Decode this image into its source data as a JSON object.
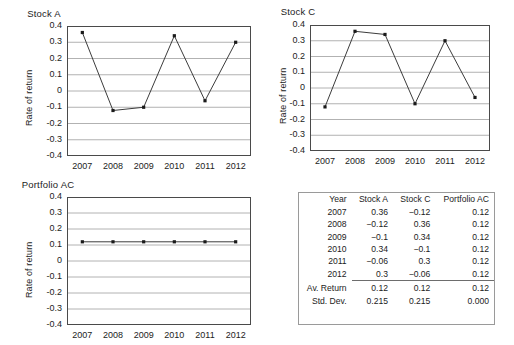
{
  "chart_data": [
    {
      "type": "line",
      "name": "stock-a",
      "title": "Stock A",
      "xlabel": "",
      "ylabel": "Rate of return",
      "categories": [
        "2007",
        "2008",
        "2009",
        "2010",
        "2011",
        "2012"
      ],
      "values": [
        0.36,
        -0.12,
        -0.1,
        0.34,
        -0.06,
        0.3
      ],
      "ylim": [
        -0.4,
        0.4
      ],
      "yticks": [
        "0.4",
        "0.3",
        "0.2",
        "0.1",
        "0",
        "-0.1",
        "-0.2",
        "-0.3",
        "-0.4"
      ],
      "ytick_values": [
        0.4,
        0.3,
        0.2,
        0.1,
        0,
        -0.1,
        -0.2,
        -0.3,
        -0.4
      ],
      "grid": true,
      "legend": "none",
      "marker": "square",
      "line_color": "#3c3c3c",
      "marker_color": "#1a1a1a"
    },
    {
      "type": "line",
      "name": "stock-c",
      "title": "Stock C",
      "xlabel": "",
      "ylabel": "Rate of return",
      "categories": [
        "2007",
        "2008",
        "2009",
        "2010",
        "2011",
        "2012"
      ],
      "values": [
        -0.12,
        0.36,
        0.34,
        -0.1,
        0.3,
        -0.06
      ],
      "ylim": [
        -0.4,
        0.4
      ],
      "yticks": [
        "0.4",
        "0.3",
        "0.2",
        "0.1",
        "0",
        "-0.1",
        "-0.2",
        "-0.3",
        "-0.4"
      ],
      "ytick_values": [
        0.4,
        0.3,
        0.2,
        0.1,
        0,
        -0.1,
        -0.2,
        -0.3,
        -0.4
      ],
      "grid": true,
      "legend": "none",
      "marker": "square",
      "line_color": "#3c3c3c",
      "marker_color": "#1a1a1a"
    },
    {
      "type": "line",
      "name": "portfolio-ac",
      "title": "Portfolio AC",
      "xlabel": "",
      "ylabel": "Rate of return",
      "categories": [
        "2007",
        "2008",
        "2009",
        "2010",
        "2011",
        "2012"
      ],
      "values": [
        0.12,
        0.12,
        0.12,
        0.12,
        0.12,
        0.12
      ],
      "ylim": [
        -0.4,
        0.4
      ],
      "yticks": [
        "0.4",
        "0.3",
        "0.2",
        "0.1",
        "0",
        "-0.1",
        "-0.2",
        "-0.3",
        "-0.4"
      ],
      "ytick_values": [
        0.4,
        0.3,
        0.2,
        0.1,
        0,
        -0.1,
        -0.2,
        -0.3,
        -0.4
      ],
      "grid": true,
      "legend": "none",
      "marker": "square",
      "line_color": "#3c3c3c",
      "marker_color": "#1a1a1a"
    },
    {
      "type": "table",
      "name": "returns-table",
      "title": "",
      "columns": [
        "Year",
        "Stock A",
        "Stock C",
        "Portfolio AC"
      ],
      "rows": [
        [
          "2007",
          "0.36",
          "−0.12",
          "0.12"
        ],
        [
          "2008",
          "−0.12",
          "0.36",
          "0.12"
        ],
        [
          "2009",
          "−0.1",
          "0.34",
          "0.12"
        ],
        [
          "2010",
          "0.34",
          "−0.1",
          "0.12"
        ],
        [
          "2011",
          "−0.06",
          "0.3",
          "0.12"
        ],
        [
          "2012",
          "0.3",
          "−0.06",
          "0.12"
        ]
      ],
      "summary_rows": [
        [
          "Av. Return",
          "0.12",
          "0.12",
          "0.12"
        ],
        [
          "Std. Dev.",
          "0.215",
          "0.215",
          "0.000"
        ]
      ]
    }
  ],
  "table": {
    "columns": [
      "Year",
      "Stock A",
      "Stock C",
      "Portfolio AC"
    ],
    "rows": [
      {
        "year": "2007",
        "stock_a": "0.36",
        "stock_c": "−0.12",
        "portfolio_ac": "0.12"
      },
      {
        "year": "2008",
        "stock_a": "−0.12",
        "stock_c": "0.36",
        "portfolio_ac": "0.12"
      },
      {
        "year": "2009",
        "stock_a": "−0.1",
        "stock_c": "0.34",
        "portfolio_ac": "0.12"
      },
      {
        "year": "2010",
        "stock_a": "0.34",
        "stock_c": "−0.1",
        "portfolio_ac": "0.12"
      },
      {
        "year": "2011",
        "stock_a": "−0.06",
        "stock_c": "0.3",
        "portfolio_ac": "0.12"
      },
      {
        "year": "2012",
        "stock_a": "0.3",
        "stock_c": "−0.06",
        "portfolio_ac": "0.12"
      }
    ],
    "summary": [
      {
        "label": "Av. Return",
        "stock_a": "0.12",
        "stock_c": "0.12",
        "portfolio_ac": "0.12"
      },
      {
        "label": "Std. Dev.",
        "stock_a": "0.215",
        "stock_c": "0.215",
        "portfolio_ac": "0.000"
      }
    ]
  },
  "colors": {
    "background": "#ffffff",
    "axis": "#4a4a4a",
    "grid": "#9e9e9e",
    "line": "#3c3c3c",
    "marker": "#1a1a1a",
    "text": "#1c1c1c",
    "table_border": "#9a9a9a",
    "table_rule": "#6d6d6d"
  }
}
